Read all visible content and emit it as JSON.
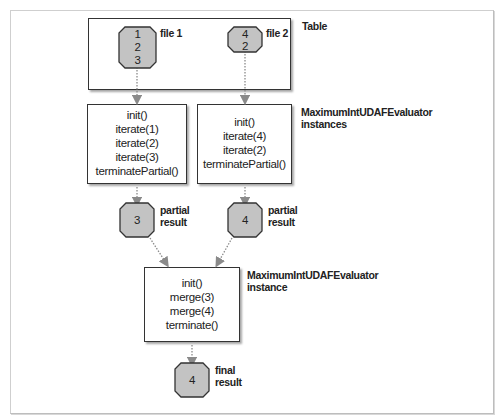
{
  "colors": {
    "node_fill": "#c3c3c3",
    "node_stroke": "#333333",
    "arrow": "#8a8a8a",
    "box_border": "#333333"
  },
  "table": {
    "label": "Table",
    "files": [
      {
        "label": "file 1",
        "values": [
          "1",
          "2",
          "3"
        ]
      },
      {
        "label": "file 2",
        "values": [
          "4",
          "2"
        ]
      }
    ]
  },
  "evaluators": {
    "label_line1": "MaximumIntUDAFEvaluator",
    "label_line2": "instances",
    "instances": [
      {
        "calls": [
          "init()",
          "iterate(1)",
          "iterate(2)",
          "iterate(3)",
          "terminatePartial()"
        ]
      },
      {
        "calls": [
          "init()",
          "iterate(4)",
          "iterate(2)",
          "terminatePartial()"
        ]
      }
    ]
  },
  "partial_results": [
    {
      "value": "3",
      "label_line1": "partial",
      "label_line2": "result"
    },
    {
      "value": "4",
      "label_line1": "partial",
      "label_line2": "result"
    }
  ],
  "merger": {
    "label_line1": "MaximumIntUDAFEvaluator",
    "label_line2": "instance",
    "calls": [
      "init()",
      "merge(3)",
      "merge(4)",
      "terminate()"
    ]
  },
  "final_result": {
    "value": "4",
    "label_line1": "final",
    "label_line2": "result"
  }
}
